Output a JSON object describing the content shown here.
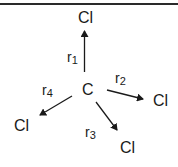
{
  "diagram": {
    "center_atom": "C",
    "atoms": [
      {
        "id": "cl_top",
        "label": "Cl"
      },
      {
        "id": "cl_right",
        "label": "Cl"
      },
      {
        "id": "cl_bottom",
        "label": "Cl"
      },
      {
        "id": "cl_left",
        "label": "Cl"
      }
    ],
    "vectors": [
      {
        "label": "r",
        "index": "1",
        "to": "cl_top"
      },
      {
        "label": "r",
        "index": "2",
        "to": "cl_right"
      },
      {
        "label": "r",
        "index": "3",
        "to": "cl_bottom"
      },
      {
        "label": "r",
        "index": "4",
        "to": "cl_left"
      }
    ],
    "colors": {
      "line": "#1a1a1a",
      "text": "#1a1a1a",
      "background": "#ffffff"
    }
  }
}
